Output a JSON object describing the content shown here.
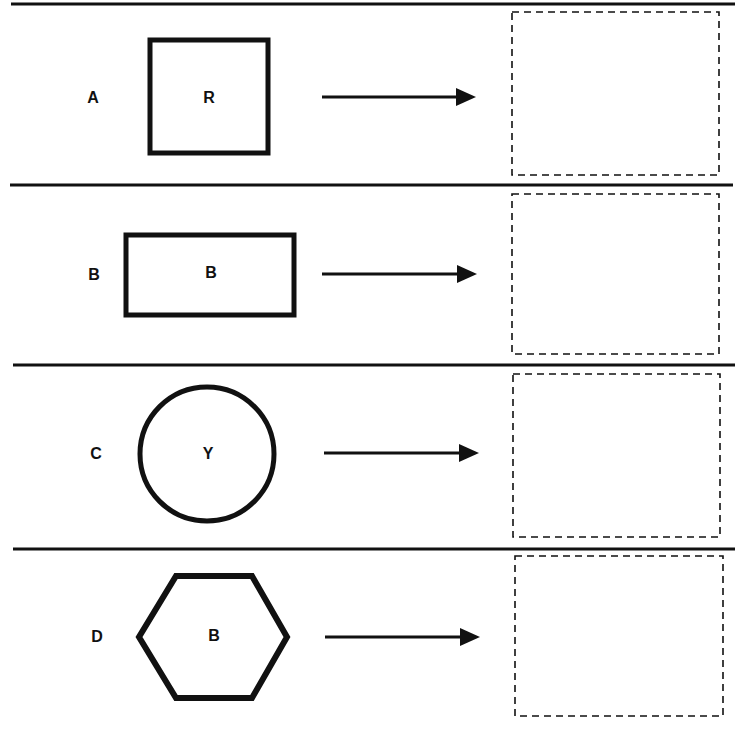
{
  "colors": {
    "ink": "#111111",
    "background": "#ffffff"
  },
  "rows": [
    {
      "row_label": "A",
      "shape": "square",
      "shape_letter": "R",
      "separator_top_y": 4,
      "label_pos": [
        93,
        103
      ],
      "shape_geom": {
        "x": 150,
        "y": 40,
        "w": 118,
        "h": 113
      },
      "letter_pos": [
        209,
        103
      ],
      "arrow": {
        "x1": 322,
        "x2": 476,
        "y": 97
      },
      "answer_box": {
        "x": 512,
        "y": 12,
        "w": 207,
        "h": 163
      }
    },
    {
      "row_label": "B",
      "shape": "rectangle",
      "shape_letter": "B",
      "separator_top_y": 185,
      "label_pos": [
        94,
        280
      ],
      "shape_geom": {
        "x": 126,
        "y": 235,
        "w": 168,
        "h": 80
      },
      "letter_pos": [
        211,
        278
      ],
      "arrow": {
        "x1": 322,
        "x2": 477,
        "y": 274
      },
      "answer_box": {
        "x": 512,
        "y": 194,
        "w": 207,
        "h": 160
      }
    },
    {
      "row_label": "C",
      "shape": "circle",
      "shape_letter": "Y",
      "separator_top_y": 365,
      "label_pos": [
        96,
        459
      ],
      "shape_geom": {
        "cx": 207,
        "cy": 454,
        "r": 67
      },
      "letter_pos": [
        208,
        459
      ],
      "arrow": {
        "x1": 324,
        "x2": 479,
        "y": 453
      },
      "answer_box": {
        "x": 513,
        "y": 374,
        "w": 207,
        "h": 163
      }
    },
    {
      "row_label": "D",
      "shape": "hexagon",
      "shape_letter": "B",
      "separator_top_y": 549,
      "label_pos": [
        97,
        642
      ],
      "shape_geom": {
        "points": "176,576 252,576 287,637 252,698 176,698 139,637"
      },
      "letter_pos": [
        214,
        641
      ],
      "arrow": {
        "x1": 325,
        "x2": 480,
        "y": 637
      },
      "answer_box": {
        "x": 515,
        "y": 556,
        "w": 208,
        "h": 160
      }
    }
  ]
}
